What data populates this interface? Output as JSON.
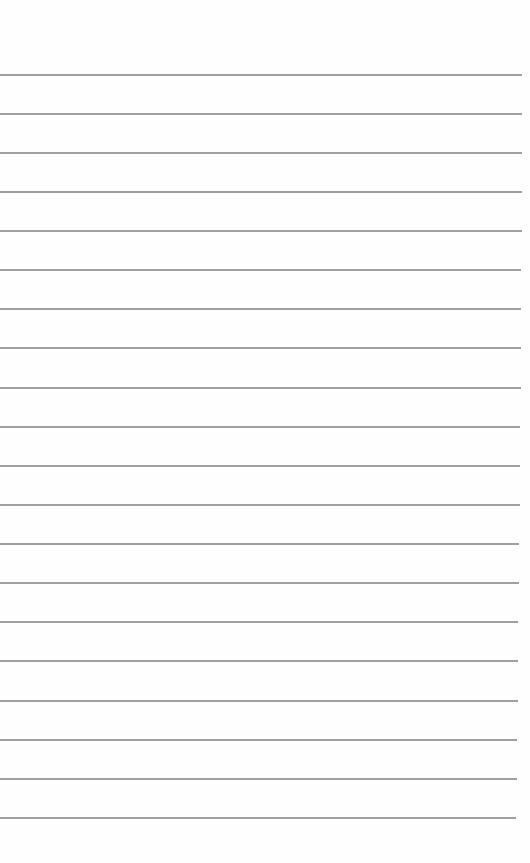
{
  "paper": {
    "type": "lined-notepad",
    "background": "#fefefe",
    "line_color": "#8f8f8f",
    "lines": [
      {
        "y": 74,
        "w": 522
      },
      {
        "y": 113,
        "w": 522
      },
      {
        "y": 152,
        "w": 522
      },
      {
        "y": 191,
        "w": 522
      },
      {
        "y": 230,
        "w": 522
      },
      {
        "y": 269,
        "w": 521
      },
      {
        "y": 308,
        "w": 521
      },
      {
        "y": 347,
        "w": 521
      },
      {
        "y": 387,
        "w": 521
      },
      {
        "y": 426,
        "w": 520
      },
      {
        "y": 465,
        "w": 520
      },
      {
        "y": 504,
        "w": 520
      },
      {
        "y": 543,
        "w": 519
      },
      {
        "y": 582,
        "w": 519
      },
      {
        "y": 621,
        "w": 518
      },
      {
        "y": 660,
        "w": 518
      },
      {
        "y": 700,
        "w": 518
      },
      {
        "y": 739,
        "w": 517
      },
      {
        "y": 778,
        "w": 517
      },
      {
        "y": 817,
        "w": 516
      }
    ]
  }
}
